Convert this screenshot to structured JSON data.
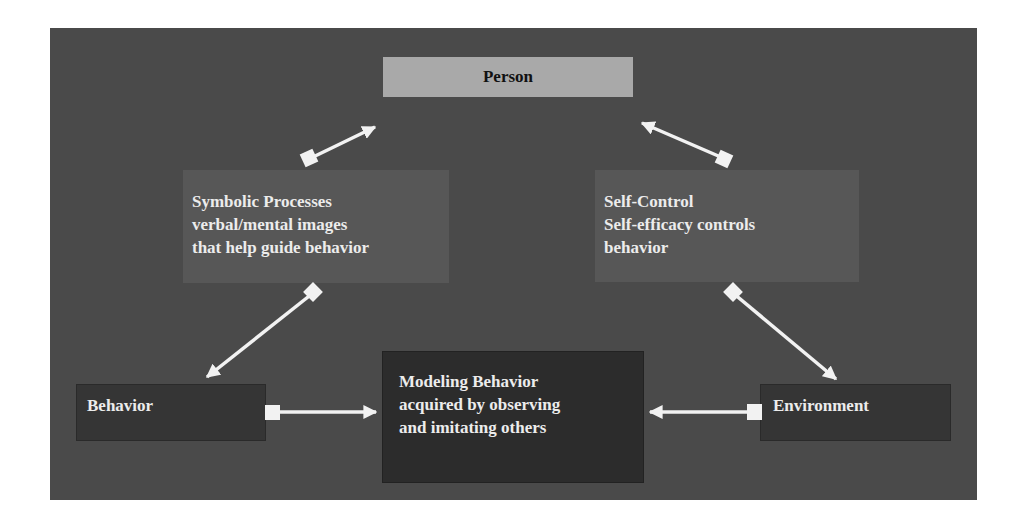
{
  "diagram": {
    "colors": {
      "frame_background": "#4a4a4a",
      "person_box": "#a9a9a9",
      "middle_boxes": "#575757",
      "bottom_boxes": "#353535",
      "center_box": "#2c2c2c",
      "arrows": "#f2f2f2",
      "text_light": "#ececec",
      "text_dark": "#111111"
    },
    "nodes": {
      "person": {
        "lines": [
          "Person"
        ]
      },
      "symbolic": {
        "lines": [
          "Symbolic Processes",
          "verbal/mental images",
          "that help guide behavior"
        ]
      },
      "selfcontrol": {
        "lines": [
          "Self-Control",
          "Self-efficacy controls",
          "behavior"
        ]
      },
      "behavior": {
        "lines": [
          "Behavior"
        ]
      },
      "modeling": {
        "lines": [
          "Modeling Behavior",
          "acquired by observing",
          "and imitating others"
        ]
      },
      "environment": {
        "lines": [
          "Environment"
        ]
      }
    },
    "edges": [
      {
        "from": "symbolic",
        "to": "person",
        "tail": "square",
        "head": "arrow"
      },
      {
        "from": "selfcontrol",
        "to": "person",
        "tail": "square",
        "head": "arrow"
      },
      {
        "from": "symbolic",
        "to": "behavior",
        "tail": "square",
        "head": "arrow"
      },
      {
        "from": "selfcontrol",
        "to": "environment",
        "tail": "square",
        "head": "arrow"
      },
      {
        "from": "behavior",
        "to": "modeling",
        "tail": "square",
        "head": "arrow"
      },
      {
        "from": "environment",
        "to": "modeling",
        "tail": "square",
        "head": "arrow"
      }
    ]
  }
}
